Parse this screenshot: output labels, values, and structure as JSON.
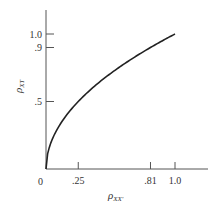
{
  "chart_data": {
    "type": "line",
    "title": "",
    "xlabel": "ρXX'",
    "ylabel": "ρXT",
    "xlabel_parts": {
      "main": "ρ",
      "sub": "XX'"
    },
    "ylabel_parts": {
      "main": "ρ",
      "sub": "XT"
    },
    "xlim": [
      0,
      1.25
    ],
    "ylim": [
      0,
      1.15
    ],
    "grid": false,
    "x_ticks": [
      {
        "value": 0.25,
        "label": ".25"
      },
      {
        "value": 0.81,
        "label": ".81"
      },
      {
        "value": 1.0,
        "label": "1.0"
      }
    ],
    "y_ticks": [
      {
        "value": 0.5,
        "label": ".5"
      },
      {
        "value": 0.9,
        "label": ".9"
      },
      {
        "value": 1.0,
        "label": "1.0"
      }
    ],
    "origin_label": "0",
    "series": [
      {
        "name": "ρXT = sqrt(ρXX')",
        "x": [
          0,
          0.05,
          0.1,
          0.15,
          0.25,
          0.35,
          0.5,
          0.65,
          0.81,
          0.9,
          1.0
        ],
        "y": [
          0,
          0.224,
          0.316,
          0.387,
          0.5,
          0.592,
          0.707,
          0.806,
          0.9,
          0.949,
          1.0
        ]
      }
    ]
  }
}
